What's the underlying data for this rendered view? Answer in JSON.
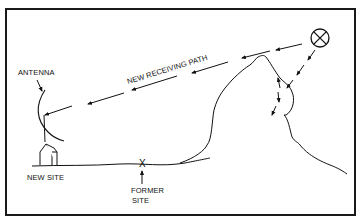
{
  "diagram": {
    "title": "",
    "labels": {
      "antenna": "ANTENNA",
      "path": "NEW RECEIVING PATH",
      "new_site": "NEW SITE",
      "former_site_line1": "FORMER",
      "former_site_line2": "SITE"
    },
    "nodes": [
      {
        "id": "transmitter",
        "icon": "circled-x-icon",
        "label": ""
      },
      {
        "id": "antenna",
        "label": "ANTENNA"
      },
      {
        "id": "new-site",
        "label": "NEW SITE"
      },
      {
        "id": "former-site",
        "label": "FORMER SITE",
        "marker": "X"
      },
      {
        "id": "mountain",
        "label": ""
      }
    ],
    "edges": [
      {
        "from": "transmitter",
        "to": "antenna",
        "label": "NEW RECEIVING PATH",
        "style": "dashed-arrows"
      },
      {
        "from": "transmitter",
        "to": "mountain",
        "label": "",
        "style": "dashed-arrows"
      }
    ],
    "colors": {
      "ink": "#111111",
      "background": "#ffffff",
      "frame": "#1a1a1a"
    }
  }
}
